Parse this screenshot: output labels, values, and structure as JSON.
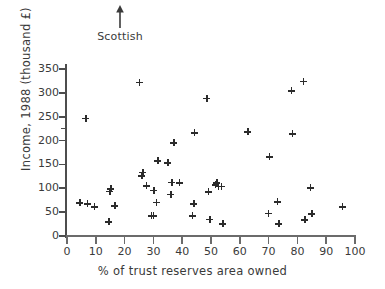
{
  "chart_data": {
    "type": "scatter",
    "title": "",
    "xlabel": "% of trust reserves area owned",
    "ylabel": "Income, 1988 (thousand £)",
    "xlim": [
      0,
      100
    ],
    "ylim": [
      0,
      350
    ],
    "xticks": [
      0,
      10,
      20,
      30,
      40,
      50,
      60,
      70,
      80,
      90,
      100
    ],
    "yticks": [
      0,
      50,
      100,
      150,
      200,
      250,
      300,
      350
    ],
    "y_minor_ticks": [
      225
    ],
    "grid": false,
    "legend": null,
    "marker": "plus",
    "marker_color": "#2b2b2b",
    "annotations": [
      {
        "text": "Scottish",
        "arrow": "up",
        "x": 9,
        "note": "arrow pointing up above plot, outside axes"
      }
    ],
    "points": [
      {
        "x": 4.5,
        "y": 70
      },
      {
        "x": 6.5,
        "y": 247
      },
      {
        "x": 7.0,
        "y": 68
      },
      {
        "x": 9.5,
        "y": 62
      },
      {
        "x": 14.5,
        "y": 30
      },
      {
        "x": 14.8,
        "y": 94
      },
      {
        "x": 15.2,
        "y": 99
      },
      {
        "x": 16.5,
        "y": 64
      },
      {
        "x": 25.0,
        "y": 322
      },
      {
        "x": 26.0,
        "y": 126
      },
      {
        "x": 26.3,
        "y": 134
      },
      {
        "x": 27.5,
        "y": 105
      },
      {
        "x": 29.3,
        "y": 42
      },
      {
        "x": 30.0,
        "y": 42
      },
      {
        "x": 30.2,
        "y": 96
      },
      {
        "x": 31.0,
        "y": 71
      },
      {
        "x": 31.5,
        "y": 158
      },
      {
        "x": 35.0,
        "y": 154
      },
      {
        "x": 36.0,
        "y": 88
      },
      {
        "x": 36.3,
        "y": 113
      },
      {
        "x": 37.0,
        "y": 195
      },
      {
        "x": 39.0,
        "y": 112
      },
      {
        "x": 43.5,
        "y": 42
      },
      {
        "x": 44.0,
        "y": 68
      },
      {
        "x": 44.2,
        "y": 217
      },
      {
        "x": 48.5,
        "y": 289
      },
      {
        "x": 49.0,
        "y": 93
      },
      {
        "x": 49.5,
        "y": 35
      },
      {
        "x": 51.5,
        "y": 108
      },
      {
        "x": 52.0,
        "y": 112
      },
      {
        "x": 52.5,
        "y": 104
      },
      {
        "x": 53.5,
        "y": 104
      },
      {
        "x": 54.0,
        "y": 26
      },
      {
        "x": 62.8,
        "y": 218
      },
      {
        "x": 69.8,
        "y": 48
      },
      {
        "x": 70.2,
        "y": 166
      },
      {
        "x": 73.0,
        "y": 72
      },
      {
        "x": 73.5,
        "y": 26
      },
      {
        "x": 77.8,
        "y": 305
      },
      {
        "x": 78.2,
        "y": 215
      },
      {
        "x": 82.0,
        "y": 324
      },
      {
        "x": 82.5,
        "y": 34
      },
      {
        "x": 84.5,
        "y": 101
      },
      {
        "x": 85.0,
        "y": 47
      },
      {
        "x": 95.5,
        "y": 62
      }
    ]
  },
  "annotation": {
    "label": "Scottish",
    "arrow_icon": "up-arrow-icon"
  }
}
